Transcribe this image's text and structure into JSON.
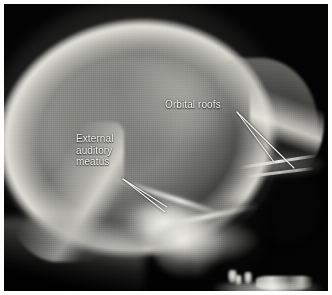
{
  "figure": {
    "type": "radiograph",
    "modality": "X-ray",
    "view": "lateral skull radiograph",
    "border_color": "#fdfdfb",
    "background_color": "#030303",
    "annotation_color": "#f4f4f0"
  },
  "annotations": [
    {
      "id": "orbital-roofs",
      "label": "Orbital roofs",
      "label_x": 161,
      "label_y": 95,
      "leader_lines": [
        {
          "x1": 233,
          "y1": 108,
          "x2": 270,
          "y2": 158
        },
        {
          "x1": 233,
          "y1": 108,
          "x2": 290,
          "y2": 164
        }
      ]
    },
    {
      "id": "external-auditory-meatus",
      "label": "External\nauditory\nmeatus",
      "label_x": 72,
      "label_y": 129,
      "leader_lines": [
        {
          "x1": 119,
          "y1": 175,
          "x2": 163,
          "y2": 203
        },
        {
          "x1": 119,
          "y1": 175,
          "x2": 161,
          "y2": 208
        }
      ]
    }
  ],
  "structures": [
    {
      "name": "cranial vault"
    },
    {
      "name": "frontal bone"
    },
    {
      "name": "occipital bone"
    },
    {
      "name": "petrous temporal bone"
    },
    {
      "name": "mandible"
    },
    {
      "name": "teeth"
    }
  ]
}
